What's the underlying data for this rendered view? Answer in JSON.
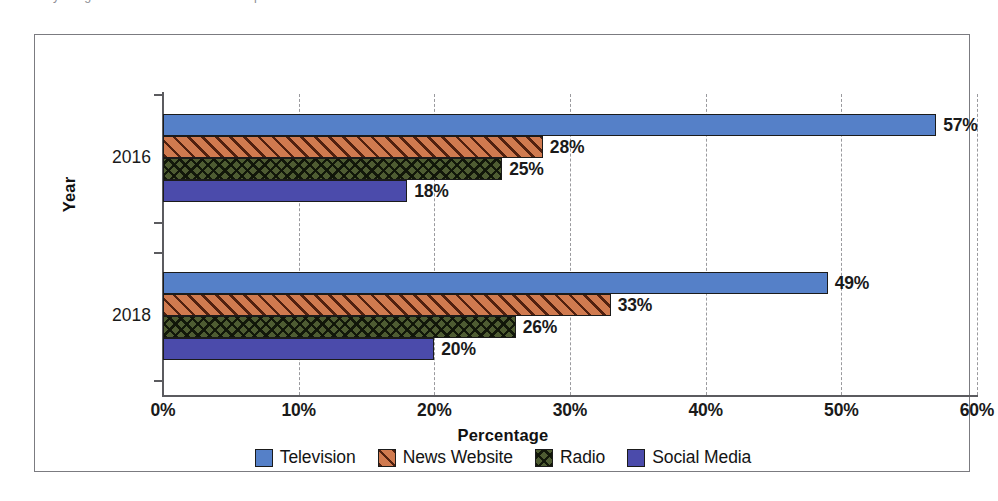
{
  "caption": {
    "text": "by the gardens and trees here in the period of the data"
  },
  "chart_data": {
    "type": "bar",
    "orientation": "horizontal",
    "title": "",
    "xlabel": "Percentage",
    "ylabel": "Year",
    "categories": [
      "2016",
      "2018"
    ],
    "xlim": [
      0,
      60
    ],
    "xticks": [
      0,
      10,
      20,
      30,
      40,
      50,
      60
    ],
    "xtick_labels": [
      "0%",
      "10%",
      "20%",
      "30%",
      "40%",
      "50%",
      "60%"
    ],
    "grid": true,
    "grid_axis": "x",
    "grid_style": "dashed",
    "legend_position": "bottom",
    "value_label_suffix": "%",
    "series": [
      {
        "name": "Television",
        "color": "#5580c8",
        "pattern": "solid",
        "values": [
          57,
          49
        ],
        "labels": [
          "57%",
          "49%"
        ]
      },
      {
        "name": "News Website",
        "color": "#d07a4f",
        "pattern": "diagonal-hatch",
        "values": [
          28,
          33
        ],
        "labels": [
          "28%",
          "33%"
        ]
      },
      {
        "name": "Radio",
        "color": "#4e5c32",
        "pattern": "crosshatch",
        "values": [
          25,
          26
        ],
        "labels": [
          "25%",
          "26%"
        ]
      },
      {
        "name": "Social Media",
        "color": "#4b4bab",
        "pattern": "solid",
        "values": [
          18,
          20
        ],
        "labels": [
          "18%",
          "20%"
        ]
      }
    ]
  }
}
